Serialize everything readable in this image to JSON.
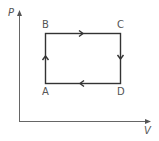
{
  "diagram": {
    "axes": {
      "y_label": "P",
      "x_label": "V"
    },
    "points": [
      {
        "name": "A",
        "label": "A",
        "position": "bottom-left"
      },
      {
        "name": "B",
        "label": "B",
        "position": "top-left"
      },
      {
        "name": "C",
        "label": "C",
        "position": "top-right"
      },
      {
        "name": "D",
        "label": "D",
        "position": "bottom-right"
      }
    ],
    "cycle": [
      "A",
      "B",
      "C",
      "D",
      "A"
    ],
    "edges": [
      {
        "from": "A",
        "to": "B",
        "direction": "up"
      },
      {
        "from": "B",
        "to": "C",
        "direction": "right"
      },
      {
        "from": "C",
        "to": "D",
        "direction": "down"
      },
      {
        "from": "D",
        "to": "A",
        "direction": "left"
      }
    ],
    "colors": {
      "cycle_line": "#333333",
      "axis_line": "#666666",
      "label": "#555555"
    }
  }
}
